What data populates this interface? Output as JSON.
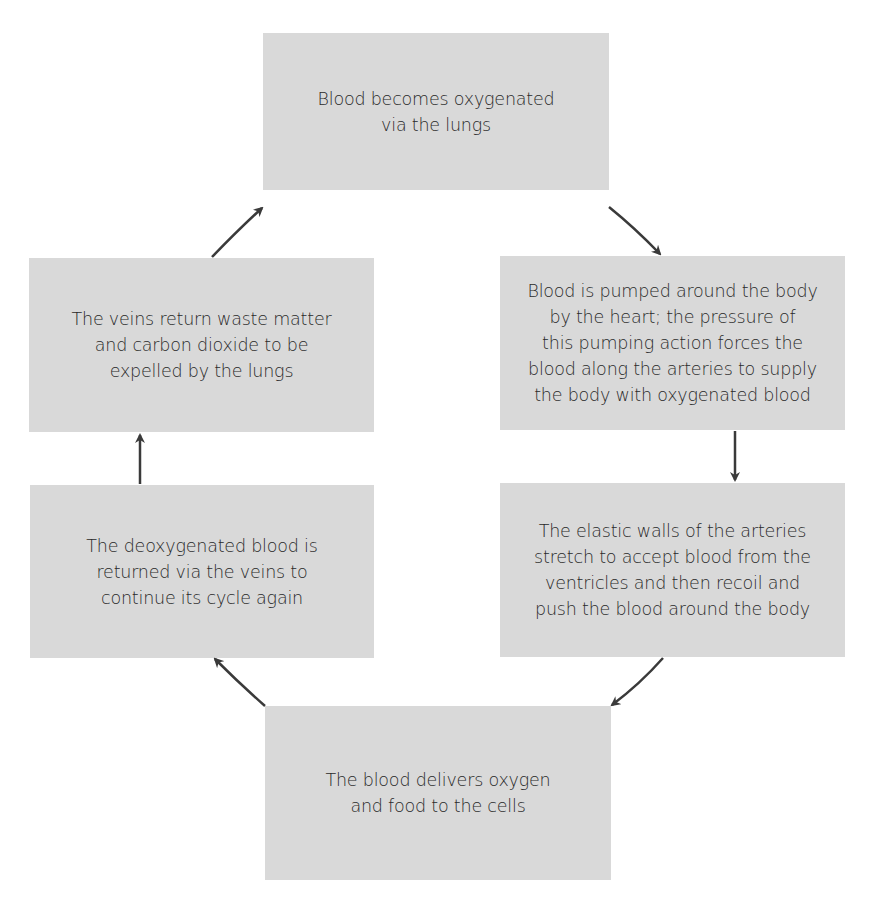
{
  "diagram": {
    "type": "cycle",
    "steps": [
      {
        "id": "top",
        "text": "Blood becomes oxygenated\nvia the lungs"
      },
      {
        "id": "right-top",
        "text": "Blood is pumped around the body\nby the heart; the pressure of\nthis pumping action forces the\nblood along the arteries to supply\nthe body with oxygenated blood"
      },
      {
        "id": "right-bottom",
        "text": "The elastic walls of the arteries\nstretch to accept blood from the\nventricles and then recoil and\npush the blood around the body"
      },
      {
        "id": "bottom",
        "text": "The blood delivers oxygen\nand food to the cells"
      },
      {
        "id": "left-bottom",
        "text": "The deoxygenated blood is\nreturned via the veins to\ncontinue its cycle again"
      },
      {
        "id": "left-top",
        "text": "The veins return waste matter\nand carbon dioxide to be\nexpelled by the lungs"
      }
    ],
    "colors": {
      "box_fill": "#d9d9d9",
      "text": "#2a2a2a",
      "arrow": "#3a3a3a"
    }
  }
}
